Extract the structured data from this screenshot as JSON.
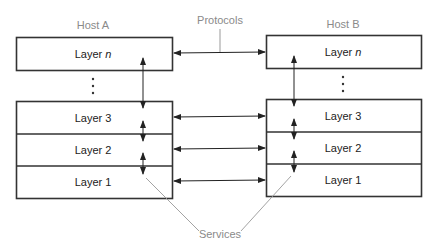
{
  "hosts": [
    {
      "name": "Host A",
      "layers": [
        {
          "prefix": "Layer ",
          "suffix": "n"
        },
        {
          "prefix": "Layer ",
          "suffix": "3"
        },
        {
          "prefix": "Layer ",
          "suffix": "2"
        },
        {
          "prefix": "Layer ",
          "suffix": "1"
        }
      ]
    },
    {
      "name": "Host B",
      "layers": [
        {
          "prefix": "Layer ",
          "suffix": "n"
        },
        {
          "prefix": "Layer ",
          "suffix": "3"
        },
        {
          "prefix": "Layer ",
          "suffix": "2"
        },
        {
          "prefix": "Layer ",
          "suffix": "1"
        }
      ]
    }
  ],
  "labels": {
    "protocols": "Protocols",
    "services": "Services",
    "ellipsis": "⋮"
  },
  "colors": {
    "stroke": "#333333",
    "label_gray": "#8a8a8a",
    "leader_gray": "#999999"
  }
}
